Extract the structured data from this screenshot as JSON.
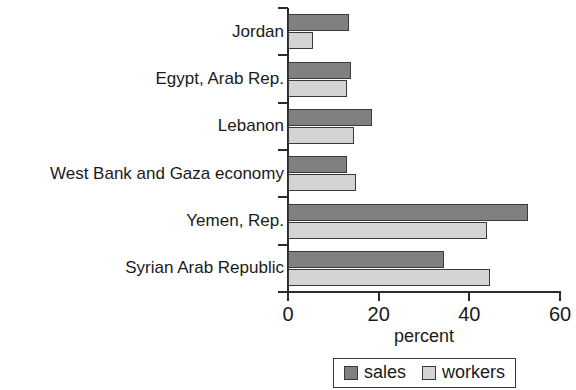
{
  "chart_data": {
    "type": "bar",
    "orientation": "horizontal",
    "title": "",
    "xlabel": "percent",
    "ylabel": "",
    "xlim": [
      0,
      60
    ],
    "xticks": [
      0,
      20,
      40,
      60
    ],
    "xtick_labels": [
      "0",
      "20",
      "40",
      "60"
    ],
    "grid": false,
    "legend_position": "bottom",
    "categories": [
      "Jordan",
      "Egypt, Arab Rep.",
      "Lebanon",
      "West Bank and Gaza economy",
      "Yemen, Rep.",
      "Syrian Arab Republic"
    ],
    "series": [
      {
        "name": "sales",
        "color": "#808080",
        "values": [
          13.5,
          14,
          18.5,
          13,
          53,
          34.5
        ]
      },
      {
        "name": "workers",
        "color": "#d4d4d4",
        "values": [
          5.5,
          13,
          14.5,
          15,
          44,
          44.5
        ]
      }
    ]
  },
  "legend": {
    "items": [
      {
        "label": "sales"
      },
      {
        "label": "workers"
      }
    ]
  }
}
